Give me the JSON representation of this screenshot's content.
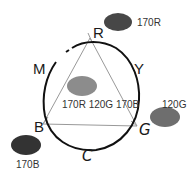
{
  "diagram": {
    "type": "color-mixing-triangle",
    "vertices": {
      "R": {
        "label": "R"
      },
      "B": {
        "label": "B"
      },
      "G": {
        "label": "G"
      }
    },
    "arc_labels": {
      "M": "M",
      "Y": "Y",
      "C": "C"
    },
    "swatches": [
      {
        "id": "red",
        "label": "170R",
        "color": "#474747"
      },
      {
        "id": "center",
        "label": "170R 120G 170B",
        "color": "#8c8c8c"
      },
      {
        "id": "green",
        "label": "120G",
        "color": "#6e6e6e"
      },
      {
        "id": "blue",
        "label": "170B",
        "color": "#333333"
      }
    ]
  },
  "colors": {
    "triangle_stroke": "#999999",
    "circle_stroke": "#111111"
  }
}
